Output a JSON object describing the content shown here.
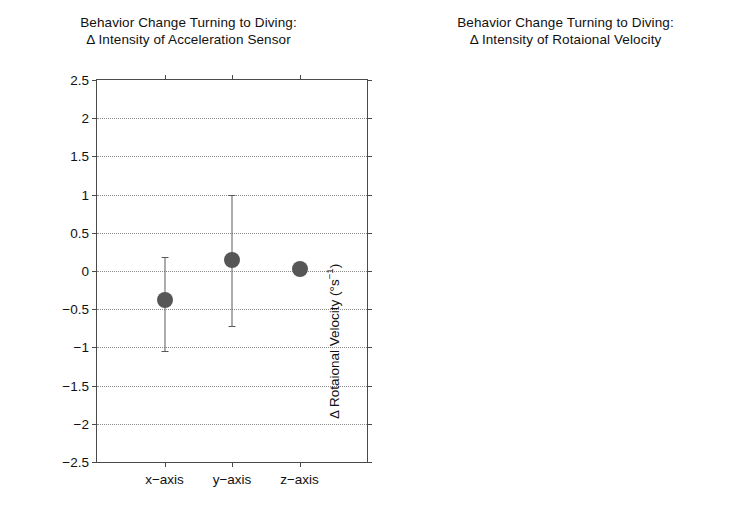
{
  "figure": {
    "background": "#ffffff",
    "marker_color": "#565656",
    "axis_color": "#4a4a4a",
    "grid_color": "#8a8a8a"
  },
  "left_panel": {
    "title_line1": "Behavior Change Turning to Diving:",
    "title_line2": "Δ Intensity of Acceleration Sensor",
    "ylabel_main": "Δ Acceleration (ms",
    "ylabel_exp": "−2",
    "ylabel_close": ")"
  },
  "right_panel": {
    "title_line1": "Behavior Change Turning to Diving:",
    "title_line2": "Δ Intensity of Rotaional Velocity",
    "ylabel_main": "Δ Rotaional Velocity (°s",
    "ylabel_exp": "−1",
    "ylabel_close": ")"
  },
  "chart_data": [
    {
      "type": "scatter",
      "title": "Behavior Change Turning to Diving: Δ Intensity of Acceleration Sensor",
      "xlabel": "",
      "ylabel": "Δ Acceleration (ms⁻²)",
      "ylim": [
        -2.5,
        2.5
      ],
      "ytick_values": [
        2.5,
        2,
        1.5,
        1,
        0.5,
        0,
        -0.5,
        -1,
        -1.5,
        -2,
        -2.5
      ],
      "ytick_labels": [
        "2.5",
        "2",
        "1.5",
        "1",
        "0.5",
        "0",
        "−0.5",
        "−1",
        "−1.5",
        "−2",
        "−2.5"
      ],
      "grid": true,
      "legend": "none",
      "categories": [
        "x−axis",
        "y−axis",
        "z−axis"
      ],
      "values": [
        -0.38,
        0.15,
        0.03
      ],
      "error_low": [
        -1.05,
        -0.72,
        0.03
      ],
      "error_high": [
        0.18,
        1.0,
        0.03
      ]
    },
    {
      "type": "scatter",
      "title": "Behavior Change Turning to Diving: Δ Intensity of Rotaional Velocity",
      "xlabel": "",
      "ylabel": "Δ Rotaional Velocity (°s⁻¹)",
      "ylim": [
        -2.5,
        2.5
      ],
      "ytick_values": [
        2.5,
        2,
        1.5,
        1,
        0.5,
        0,
        -0.5,
        -1,
        -1.5,
        -2,
        -2.5
      ],
      "ytick_labels": [
        "2.5",
        "2",
        "1.5",
        "1",
        "0.5",
        "0",
        "−0.5",
        "−1",
        "−1.5",
        "−2",
        "−2.5"
      ],
      "grid": true,
      "legend": "none",
      "categories": [
        "z−axis",
        "x−axis"
      ],
      "values": [
        -1.63,
        2.26
      ],
      "error_low": [
        -2.5,
        1.5
      ],
      "error_high": [
        2.5,
        2.5
      ]
    }
  ]
}
